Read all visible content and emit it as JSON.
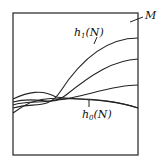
{
  "figure": {
    "region_label": "M",
    "upper_curve_label": {
      "base": "h",
      "sub": "1",
      "arg": "(N)"
    },
    "lower_curve_label": {
      "base": "h",
      "sub": "0",
      "arg": "(N)"
    },
    "stroke_color": "#222222",
    "curves": [
      {
        "name": "h1",
        "d": "M13,107 C40,100 50,112 62,90 C85,55 110,40 138,38"
      },
      {
        "name": "mid-upper",
        "d": "M13,104 C35,98 55,108 70,94 C95,72 115,60 138,59"
      },
      {
        "name": "mid-lower",
        "d": "M13,101 C35,95 50,101 60,99 C85,97 115,85 138,85"
      },
      {
        "name": "h0-family",
        "d": "M13,99 C30,92 40,90 55,99 C80,100 115,97 138,108"
      },
      {
        "name": "h0",
        "d": "M13,112 C35,95 45,95 60,99 C90,98 115,99 138,108"
      }
    ]
  }
}
